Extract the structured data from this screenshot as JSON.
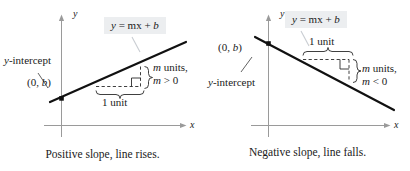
{
  "figure": {
    "background_color": "#ffffff",
    "ink_color": "#1a1a1a",
    "equation_box_color": "#eceef0"
  },
  "panels": [
    {
      "id": "positive-slope",
      "axis_x_label": "x",
      "axis_y_label": "y",
      "equation_label": "y = mx + b",
      "equation_parts": {
        "y": "y",
        "eq": "=",
        "m": "m",
        "x": "x",
        "plus": "+",
        "b": "b"
      },
      "intercept_label": "y-intercept",
      "point_label": "(0, b)",
      "run_label": "1 unit",
      "rise_label_line1": "m units,",
      "rise_label_line2": "m > 0",
      "rise_units_word": "units,",
      "rise_condition": "m > 0",
      "caption": "Positive slope, line rises.",
      "slope_sign": "positive"
    },
    {
      "id": "negative-slope",
      "axis_x_label": "x",
      "axis_y_label": "y",
      "equation_label": "y = mx + b",
      "equation_parts": {
        "y": "y",
        "eq": "=",
        "m": "m",
        "x": "x",
        "plus": "+",
        "b": "b"
      },
      "intercept_label": "y-intercept",
      "point_label": "(0, b)",
      "run_label": "1 unit",
      "rise_label_line1": "m units,",
      "rise_label_line2": "m < 0",
      "rise_units_word": "units,",
      "rise_condition": "m < 0",
      "caption": "Negative slope, line falls.",
      "slope_sign": "negative"
    }
  ],
  "chart_data": {
    "type": "line",
    "xlabel": "x",
    "ylabel": "y",
    "grid": false,
    "legend": "none",
    "series": [
      {
        "name": "Positive slope, line rises.",
        "equation": "y = mx + b",
        "slope_sign": "positive",
        "annotations": [
          "y-intercept",
          "(0, b)",
          "1 unit",
          "m units,",
          "m > 0"
        ]
      },
      {
        "name": "Negative slope, line falls.",
        "equation": "y = mx + b",
        "slope_sign": "negative",
        "annotations": [
          "y-intercept",
          "(0, b)",
          "1 unit",
          "m units,",
          "m < 0"
        ]
      }
    ]
  }
}
